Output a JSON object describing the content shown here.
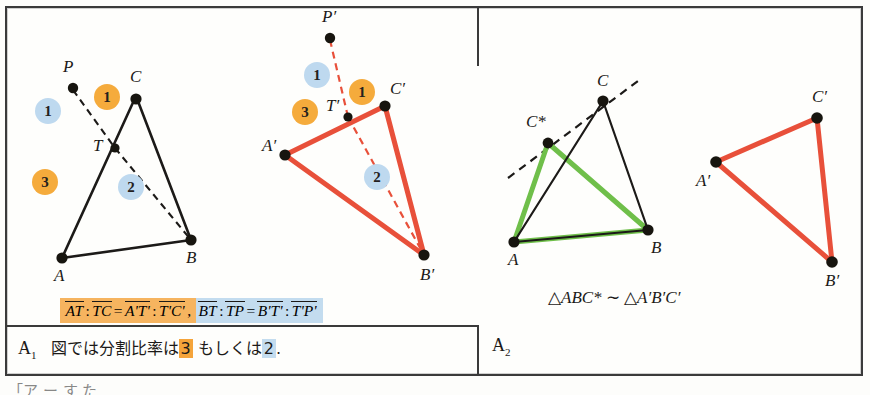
{
  "figure": {
    "panels": [
      {
        "tag": "A",
        "tag_sub": "1",
        "caption_parts": [
          {
            "text": "図では分割比率は",
            "mark": "none"
          },
          {
            "text": "3",
            "mark": "orange"
          },
          {
            "text": " もしくは",
            "mark": "none"
          },
          {
            "text": "2",
            "mark": "blue"
          },
          {
            "text": ".",
            "mark": "none"
          }
        ],
        "caption_full": "図では分割比率は3 もしくは2."
      },
      {
        "tag": "A",
        "tag_sub": "2",
        "similarity": "△ABC* ~ △A'B'C'"
      }
    ]
  },
  "formula": {
    "orange_group": {
      "terms": [
        "AT",
        "TC",
        "A'T'",
        "T'C'"
      ],
      "ratio_colon": ":",
      "equals": "=",
      "trailing_comma": ","
    },
    "blue_group": {
      "terms": [
        "BT",
        "TP",
        "B'T'",
        "T'P'"
      ],
      "ratio_colon": ":",
      "equals": "="
    },
    "plain": "AT : TC = A'T' : T'C',  BT : TP = B'T' : T'P'"
  },
  "similarity": {
    "tri": "△",
    "left": "ABC*",
    "relation": "∼",
    "right": "A′B′C′"
  },
  "diagram_a1_left": {
    "name": "black-triangle-with-cevian",
    "points": {
      "P": {
        "label": "P",
        "x": 73,
        "y": 85
      },
      "C": {
        "label": "C",
        "x": 136,
        "y": 96
      },
      "T": {
        "label": "T",
        "x": 115,
        "y": 148
      },
      "A": {
        "label": "A",
        "x": 62,
        "y": 258
      },
      "B": {
        "label": "B",
        "x": 191,
        "y": 240
      }
    },
    "solid_edges": [
      [
        "A",
        "C"
      ],
      [
        "C",
        "B"
      ],
      [
        "A",
        "B"
      ]
    ],
    "dashed_edges": [
      [
        "P",
        "T"
      ],
      [
        "T",
        "B"
      ]
    ],
    "badges": [
      {
        "value": "1",
        "color": "blue",
        "x": 48,
        "y": 111
      },
      {
        "value": "1",
        "color": "orange",
        "x": 107,
        "y": 97
      },
      {
        "value": "3",
        "color": "orange",
        "x": 45,
        "y": 182
      },
      {
        "value": "2",
        "color": "blue",
        "x": 131,
        "y": 187
      }
    ]
  },
  "diagram_a1_right": {
    "name": "red-triangle-with-cevian",
    "points": {
      "P'": {
        "label": "P′",
        "x": 330,
        "y": 35
      },
      "C'": {
        "label": "C′",
        "x": 385,
        "y": 106
      },
      "T'": {
        "label": "T′",
        "x": 348,
        "y": 117
      },
      "A'": {
        "label": "A′",
        "x": 285,
        "y": 155
      },
      "B'": {
        "label": "B′",
        "x": 424,
        "y": 255
      }
    },
    "solid_edges": [
      [
        "A'",
        "C'"
      ],
      [
        "C'",
        "B'"
      ],
      [
        "A'",
        "B'"
      ]
    ],
    "dashed_edges": [
      [
        "P'",
        "T'"
      ],
      [
        "T'",
        "B'"
      ]
    ],
    "badges": [
      {
        "value": "1",
        "color": "blue",
        "x": 317,
        "y": 75
      },
      {
        "value": "1",
        "color": "orange",
        "x": 362,
        "y": 92
      },
      {
        "value": "3",
        "color": "orange",
        "x": 305,
        "y": 112
      },
      {
        "value": "2",
        "color": "blue",
        "x": 377,
        "y": 177
      }
    ]
  },
  "diagram_a2_left": {
    "name": "triangle-abc-with-cstar",
    "points": {
      "C": {
        "label": "C",
        "x": 603,
        "y": 101
      },
      "C*": {
        "label": "C*",
        "x": 548,
        "y": 143
      },
      "A": {
        "label": "A",
        "x": 514,
        "y": 242
      },
      "B": {
        "label": "B",
        "x": 648,
        "y": 230
      }
    },
    "black_edges": [
      [
        "A",
        "C"
      ],
      [
        "C",
        "B"
      ],
      [
        "A",
        "B"
      ]
    ],
    "green_edges": [
      [
        "A",
        "C*"
      ],
      [
        "C*",
        "B"
      ],
      [
        "A",
        "B"
      ]
    ],
    "dashed_line": {
      "from": {
        "x": 512,
        "y": 170
      },
      "to": {
        "x": 638,
        "y": 77
      }
    }
  },
  "diagram_a2_right": {
    "name": "red-triangle-image",
    "points": {
      "C'": {
        "label": "C′",
        "x": 817,
        "y": 118
      },
      "A'": {
        "label": "A′",
        "x": 716,
        "y": 162
      },
      "B'": {
        "label": "B′",
        "x": 832,
        "y": 262
      }
    },
    "solid_edges": [
      [
        "A'",
        "C'"
      ],
      [
        "C'",
        "B'"
      ],
      [
        "A'",
        "B'"
      ]
    ]
  },
  "colors": {
    "orange_badge": "#f5ab3c",
    "blue_badge": "#bed9ef",
    "red_line": "#e8503a",
    "green_line": "#6fbf4a",
    "black_line": "#1c1a18",
    "highlight_orange": "#f6b45f",
    "highlight_blue": "#c3dcef",
    "frame": "#3a3a3a"
  },
  "bleed_text": "「ア  ー  す  た"
}
